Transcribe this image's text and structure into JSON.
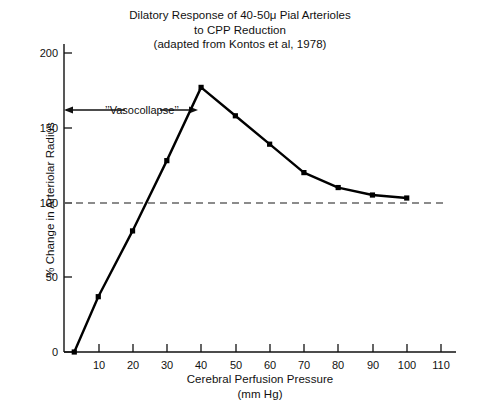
{
  "chart_data": {
    "type": "line",
    "title": "Dilatory Response of 40-50μ Pial Arterioles to CPP Reduction (adapted from Kontos et al, 1978)",
    "title_lines": [
      "Dilatory Response of 40-50μ Pial Arterioles",
      "to CPP Reduction",
      "(adapted from Kontos et al, 1978)"
    ],
    "xlabel": "Cerebral Perfusion Pressure",
    "xlabel_units": "(mm Hg)",
    "ylabel": "% Change in Arteriolar Radius",
    "xlim": [
      0,
      113
    ],
    "ylim": [
      0,
      215
    ],
    "xticks": [
      10,
      20,
      30,
      40,
      50,
      60,
      70,
      80,
      90,
      100,
      110
    ],
    "xtick_labels": [
      "10",
      "20",
      "30",
      "40",
      "50",
      "60",
      "70",
      "80",
      "90",
      "100",
      "110"
    ],
    "yticks": [
      0,
      50,
      100,
      150,
      200
    ],
    "ytick_labels": [
      "0",
      "50",
      "100",
      "150",
      "200"
    ],
    "grid": false,
    "legend": false,
    "x": [
      3,
      10,
      20,
      30,
      40,
      50,
      60,
      70,
      80,
      90,
      100
    ],
    "values": [
      0,
      37,
      81,
      128,
      177,
      158,
      139,
      120,
      110,
      105,
      103
    ],
    "series": [
      {
        "name": "% Change in Arteriolar Radius",
        "x": [
          3,
          10,
          20,
          30,
          40,
          50,
          60,
          70,
          80,
          90,
          100
        ],
        "values": [
          0,
          37,
          81,
          128,
          177,
          158,
          139,
          120,
          110,
          105,
          103
        ],
        "marker": "filled-square",
        "color": "#000000"
      }
    ],
    "reference_lines": [
      {
        "name": "baseline-100",
        "axis": "y",
        "value": 100,
        "style": "dashed",
        "color": "#555555",
        "x_from": 0,
        "x_to": 112
      }
    ],
    "annotations": [
      {
        "name": "vasocollapse-span",
        "text": "’’Vasocollapse’’",
        "y": 163,
        "x_from": 0,
        "x_to": 34,
        "arrow": "double-headed"
      }
    ]
  },
  "axes": {
    "y_axis_name": "% Change in Arteriolar Radius",
    "x_axis_name": "Cerebral Perfusion Pressure"
  }
}
